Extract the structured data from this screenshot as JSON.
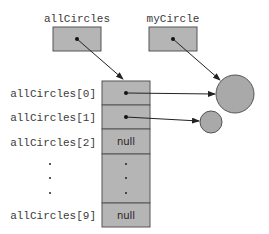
{
  "variables": [
    {
      "name": "allCircles",
      "value": "reference"
    },
    {
      "name": "myCircle",
      "value": "reference"
    }
  ],
  "array": {
    "name": "allCircles",
    "index_labels": [
      "allCircles[0]",
      "allCircles[1]",
      "allCircles[2]",
      "allCircles[9]"
    ],
    "cells": [
      {
        "index": 0,
        "value": "reference"
      },
      {
        "index": 1,
        "value": "reference"
      },
      {
        "index": 2,
        "value": "null"
      },
      {
        "index": "3-8",
        "value": "ellipsis"
      },
      {
        "index": 9,
        "value": "null"
      }
    ],
    "null_label": "null"
  },
  "objects": [
    {
      "name": "circle-large",
      "referenced_by": [
        "myCircle",
        "allCircles[0]"
      ]
    },
    {
      "name": "circle-small",
      "referenced_by": [
        "allCircles[1]"
      ]
    }
  ],
  "colors": {
    "box_fill": "#b5b5b5",
    "circle_fill": "#a9a9a9",
    "stroke": "#555555",
    "label": "#3a3a3a"
  }
}
